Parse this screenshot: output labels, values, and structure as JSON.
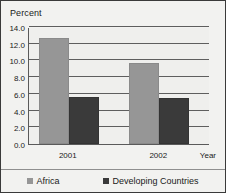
{
  "chart_data": {
    "type": "bar",
    "title": "",
    "subtitle": "",
    "xlabel": "Year",
    "ylabel": "Percent",
    "categories": [
      "2001",
      "2002"
    ],
    "series": [
      {
        "name": "Africa",
        "values": [
          12.7,
          9.7
        ],
        "color": "#969696"
      },
      {
        "name": "Developing Countries",
        "values": [
          5.6,
          5.5
        ],
        "color": "#3a3a3a"
      }
    ],
    "ylim": [
      0.0,
      14.0
    ],
    "ytick_step": 2.0,
    "ytick_labels": [
      "14.0",
      "12.0",
      "10.0",
      "8.0",
      "6.0",
      "4.0",
      "2.0",
      "0.0"
    ],
    "ytick_values": [
      14.0,
      12.0,
      10.0,
      8.0,
      6.0,
      4.0,
      2.0,
      0.0
    ],
    "grid": true,
    "grid_axis": "y",
    "legend_position": "bottom",
    "legend_entries": [
      "Africa",
      "Developing Countries"
    ],
    "plot_background": "#efefed",
    "figure_background": "#f2f2f0",
    "border_color": "#3a3a3a"
  }
}
